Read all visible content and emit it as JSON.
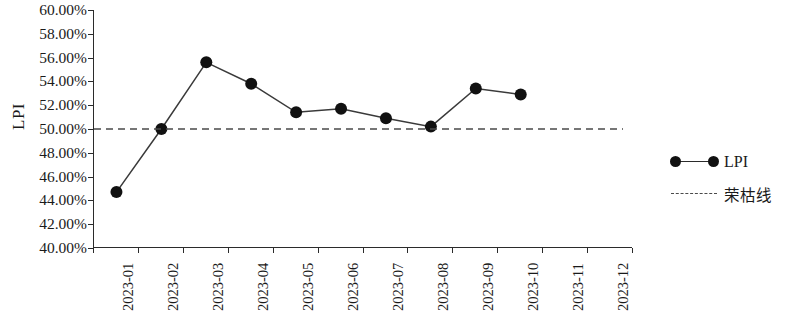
{
  "chart_data": {
    "type": "line",
    "title": "",
    "xlabel": "",
    "ylabel": "LPI",
    "categories": [
      "2023-01",
      "2023-02",
      "2023-03",
      "2023-04",
      "2023-05",
      "2023-06",
      "2023-07",
      "2023-08",
      "2023-09",
      "2023-10",
      "2023-11",
      "2023-12"
    ],
    "series": [
      {
        "name": "LPI",
        "values": [
          44.7,
          50.0,
          55.6,
          53.8,
          51.4,
          51.7,
          50.9,
          50.2,
          53.4,
          52.9,
          null,
          null
        ],
        "marker": "circle",
        "color": "#111111"
      },
      {
        "name": "荣枯线",
        "type": "reference-line",
        "value": 50.0,
        "style": "dashed",
        "color": "#4a4a4a"
      }
    ],
    "ylim": [
      40,
      60
    ],
    "ytick_step": 2,
    "ytick_labels": [
      "60.00%",
      "58.00%",
      "56.00%",
      "54.00%",
      "52.00%",
      "50.00%",
      "48.00%",
      "46.00%",
      "44.00%",
      "42.00%",
      "40.00%"
    ],
    "ytick_values": [
      60,
      58,
      56,
      54,
      52,
      50,
      48,
      46,
      44,
      42,
      40
    ],
    "grid": false,
    "legend_position": "right"
  },
  "legend": {
    "items": [
      {
        "label": "LPI",
        "key": "line-marker"
      },
      {
        "label": "荣枯线",
        "key": "dashed-line"
      }
    ]
  }
}
